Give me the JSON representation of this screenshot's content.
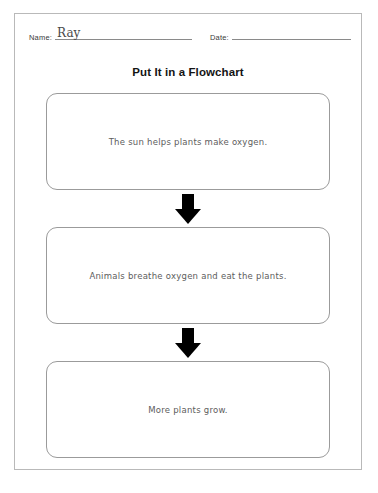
{
  "page": {
    "title": "Put It in a Flowchart"
  },
  "header": {
    "name_label": "Name:",
    "name_value": "Ray",
    "date_label": "Date:",
    "date_value": ""
  },
  "flowchart": {
    "steps": [
      {
        "text": "The sun helps plants make oxygen."
      },
      {
        "text": "Animals breathe oxygen and eat the plants."
      },
      {
        "text": "More plants grow."
      }
    ],
    "connector": "down-arrow"
  },
  "footer": {
    "scrap_text": ""
  },
  "colors": {
    "page_border": "#b9b9b9",
    "box_border": "#9b9b9b",
    "box_text": "#5d5d5d",
    "title_text": "#141414",
    "rule_line": "#8a8a8a",
    "arrow": "#000000",
    "handwriting": "#4a4a4a"
  }
}
